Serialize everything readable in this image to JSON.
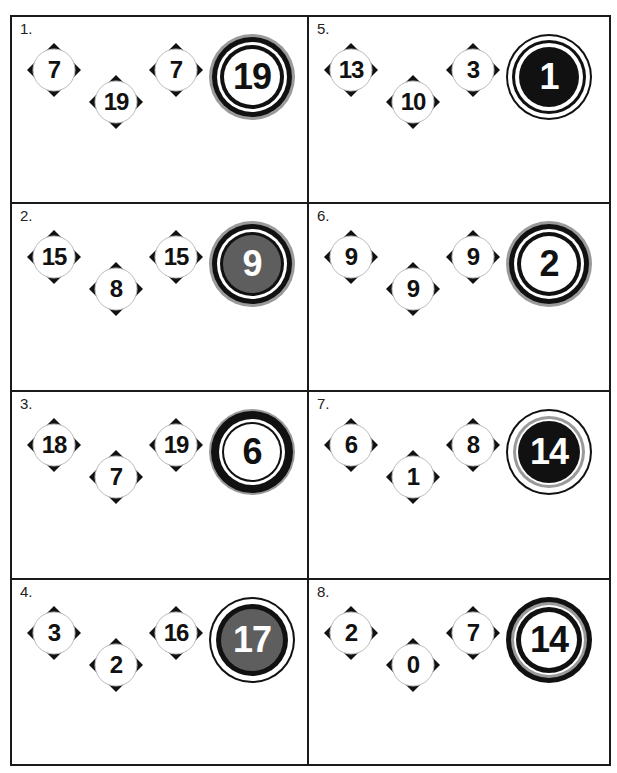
{
  "puzzles": [
    {
      "label": "1.",
      "diamonds": [
        "7",
        "19",
        "7"
      ],
      "target": "19",
      "style": "white-gray-halo"
    },
    {
      "label": "2.",
      "diamonds": [
        "15",
        "8",
        "15"
      ],
      "target": "9",
      "style": "gray-fill"
    },
    {
      "label": "3.",
      "diamonds": [
        "18",
        "7",
        "19"
      ],
      "target": "6",
      "style": "thick-black-ring"
    },
    {
      "label": "4.",
      "diamonds": [
        "3",
        "2",
        "16"
      ],
      "target": "17",
      "style": "gray-fill-thin-ring"
    },
    {
      "label": "5.",
      "diamonds": [
        "13",
        "10",
        "3"
      ],
      "target": "1",
      "style": "black-fill"
    },
    {
      "label": "6.",
      "diamonds": [
        "9",
        "9",
        "9"
      ],
      "target": "2",
      "style": "white-gray-halo"
    },
    {
      "label": "7.",
      "diamonds": [
        "6",
        "1",
        "8"
      ],
      "target": "14",
      "style": "black-fill-gray-ring"
    },
    {
      "label": "8.",
      "diamonds": [
        "2",
        "0",
        "7"
      ],
      "target": "14",
      "style": "white-double-ring"
    }
  ],
  "colors": {
    "border": "#1a1a1a",
    "ink": "#111111",
    "gray_fill": "#5e5e5e",
    "gray_ring": "#9a9a9a",
    "white": "#ffffff"
  }
}
